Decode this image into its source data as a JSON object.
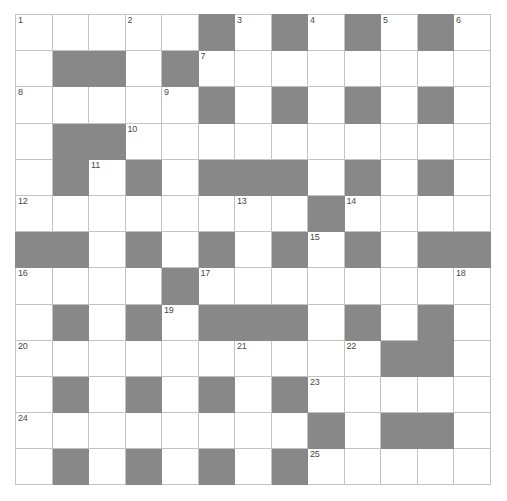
{
  "puzzle": {
    "title": "Crossword Grid",
    "rows": 13,
    "cols": 13,
    "cell_size_px": 36,
    "colors": {
      "block": "#888888",
      "cell": "#ffffff",
      "gridline": "#c3c3c3",
      "border": "#a0a0a0",
      "number_text": "#4a4a4a"
    },
    "highest_clue_number": 25,
    "grid": [
      [
        "white",
        "white",
        "white",
        "white",
        "white",
        "black",
        "white",
        "black",
        "white",
        "black",
        "white",
        "black",
        "white"
      ],
      [
        "white",
        "black",
        "black",
        "white",
        "black",
        "white",
        "white",
        "white",
        "white",
        "white",
        "white",
        "white",
        "white"
      ],
      [
        "white",
        "white",
        "white",
        "white",
        "white",
        "black",
        "white",
        "black",
        "white",
        "black",
        "white",
        "black",
        "white"
      ],
      [
        "white",
        "black",
        "black",
        "white",
        "white",
        "white",
        "white",
        "white",
        "white",
        "white",
        "white",
        "white",
        "white"
      ],
      [
        "white",
        "black",
        "white",
        "black",
        "white",
        "black",
        "black",
        "black",
        "white",
        "black",
        "white",
        "black",
        "white"
      ],
      [
        "white",
        "white",
        "white",
        "white",
        "white",
        "white",
        "white",
        "white",
        "black",
        "white",
        "white",
        "white",
        "white"
      ],
      [
        "black",
        "black",
        "white",
        "black",
        "white",
        "black",
        "white",
        "black",
        "white",
        "black",
        "white",
        "black",
        "black"
      ],
      [
        "white",
        "white",
        "white",
        "white",
        "black",
        "white",
        "white",
        "white",
        "white",
        "white",
        "white",
        "white",
        "white"
      ],
      [
        "white",
        "black",
        "white",
        "black",
        "white",
        "black",
        "black",
        "black",
        "white",
        "black",
        "white",
        "black",
        "white"
      ],
      [
        "white",
        "white",
        "white",
        "white",
        "white",
        "white",
        "white",
        "white",
        "white",
        "white",
        "black",
        "black",
        "white"
      ],
      [
        "white",
        "black",
        "white",
        "black",
        "white",
        "black",
        "white",
        "black",
        "white",
        "white",
        "white",
        "white",
        "white"
      ],
      [
        "white",
        "white",
        "white",
        "white",
        "white",
        "white",
        "white",
        "white",
        "black",
        "white",
        "black",
        "black",
        "white"
      ],
      [
        "white",
        "black",
        "white",
        "black",
        "white",
        "black",
        "white",
        "black",
        "white",
        "white",
        "white",
        "white",
        "white"
      ]
    ],
    "numbers": [
      {
        "n": "1",
        "row": 0,
        "col": 0
      },
      {
        "n": "2",
        "row": 0,
        "col": 3
      },
      {
        "n": "3",
        "row": 0,
        "col": 6
      },
      {
        "n": "4",
        "row": 0,
        "col": 8
      },
      {
        "n": "5",
        "row": 0,
        "col": 10
      },
      {
        "n": "6",
        "row": 0,
        "col": 12
      },
      {
        "n": "7",
        "row": 1,
        "col": 5
      },
      {
        "n": "8",
        "row": 2,
        "col": 0
      },
      {
        "n": "9",
        "row": 2,
        "col": 4
      },
      {
        "n": "10",
        "row": 3,
        "col": 3
      },
      {
        "n": "11",
        "row": 4,
        "col": 2
      },
      {
        "n": "12",
        "row": 5,
        "col": 0
      },
      {
        "n": "13",
        "row": 5,
        "col": 6
      },
      {
        "n": "14",
        "row": 5,
        "col": 9
      },
      {
        "n": "15",
        "row": 6,
        "col": 8
      },
      {
        "n": "16",
        "row": 7,
        "col": 0
      },
      {
        "n": "17",
        "row": 7,
        "col": 5
      },
      {
        "n": "18",
        "row": 7,
        "col": 12
      },
      {
        "n": "19",
        "row": 8,
        "col": 4
      },
      {
        "n": "20",
        "row": 9,
        "col": 0
      },
      {
        "n": "21",
        "row": 9,
        "col": 6
      },
      {
        "n": "22",
        "row": 9,
        "col": 9
      },
      {
        "n": "23",
        "row": 10,
        "col": 8
      },
      {
        "n": "24",
        "row": 11,
        "col": 0
      },
      {
        "n": "25",
        "row": 12,
        "col": 8
      }
    ],
    "letters": []
  }
}
